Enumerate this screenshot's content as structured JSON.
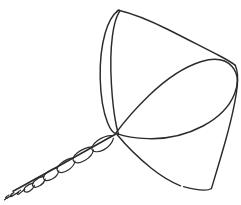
{
  "image": {
    "kind": "line-drawing",
    "subject": "conical hand net with twisted cord handle",
    "title": "Cone-shaped net sketch",
    "background_color": "#ffffff",
    "ink_color": "#2b2b2b",
    "width": 241,
    "height": 205,
    "style": "hand-drawn contour sketch, no shading, no text labels"
  },
  "parts": {
    "rim_ellipse": {
      "name": "net mouth rim",
      "description": "elongated pointed ellipse running from the apex up and to the right"
    },
    "left_edge_loop": {
      "name": "left rim edge seen edge-on",
      "description": "narrow elongated loop from top point down to the apex"
    },
    "top_edge": {
      "name": "upper cone edge",
      "description": "long gentle curve from top point sweeping right and down"
    },
    "right_edge": {
      "name": "right cone edge",
      "description": "curve descending from right of the rim to the lower corner"
    },
    "bottom_edge": {
      "name": "lower cone edge",
      "description": "curve sagging from the apex down to the lower right corner"
    },
    "handle_cord": {
      "name": "twisted cord handle",
      "description": "braided twisted strand extending from the apex to the lower left corner"
    },
    "apex": {
      "name": "convergence point",
      "description": "point where rim, edges and cord all meet",
      "x": 116,
      "y": 133
    }
  }
}
